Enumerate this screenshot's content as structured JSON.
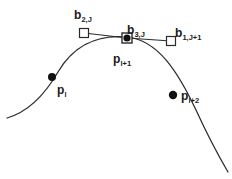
{
  "figure": {
    "background_color": "#ffffff",
    "stroke_color": "#2b2b2b",
    "marker_fill_color": "#111111",
    "width": 232,
    "height": 179,
    "labels": {
      "b2J": {
        "base": "b",
        "sub": "2,J"
      },
      "b3J": {
        "base": "b",
        "sub": "3,J"
      },
      "b1J1": {
        "base": "b",
        "sub": "1,J+1"
      },
      "pl1": {
        "base": "p",
        "sub": "l+1"
      },
      "pl": {
        "base": "p",
        "sub": "l"
      },
      "pl2": {
        "base": "p",
        "sub": "l+2"
      }
    },
    "geometry": {
      "curve_path": "M 7 118 C 28 112 44 96 58 72 C 72 48 95 34 127 37 C 158 40 178 72 196 110 C 207 134 218 155 228 172",
      "tangent_polyline": "84,33 127,38 171,41",
      "square_markers": [
        {
          "name": "b2J-square",
          "x": 84,
          "y": 33,
          "size": 9
        },
        {
          "name": "b3J-square",
          "x": 127,
          "y": 38,
          "size": 10
        },
        {
          "name": "b1J1-square",
          "x": 171,
          "y": 41,
          "size": 9
        }
      ],
      "dot_markers": [
        {
          "name": "pl1-dot",
          "cx": 127,
          "cy": 38,
          "r": 3.6
        },
        {
          "name": "pl-dot",
          "cx": 52,
          "cy": 77,
          "r": 4.0
        },
        {
          "name": "pl2-dot",
          "cx": 173,
          "cy": 95,
          "r": 4.2
        }
      ]
    }
  }
}
